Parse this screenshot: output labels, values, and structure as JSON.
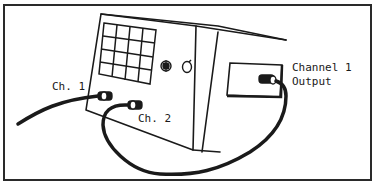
{
  "diagram": {
    "labels": {
      "ch1": "Ch. 1",
      "ch2": "Ch. 2",
      "output_line1": "Channel 1",
      "output_line2": "Output"
    },
    "colors": {
      "ink": "#1a1a1a",
      "background": "#ffffff"
    }
  }
}
